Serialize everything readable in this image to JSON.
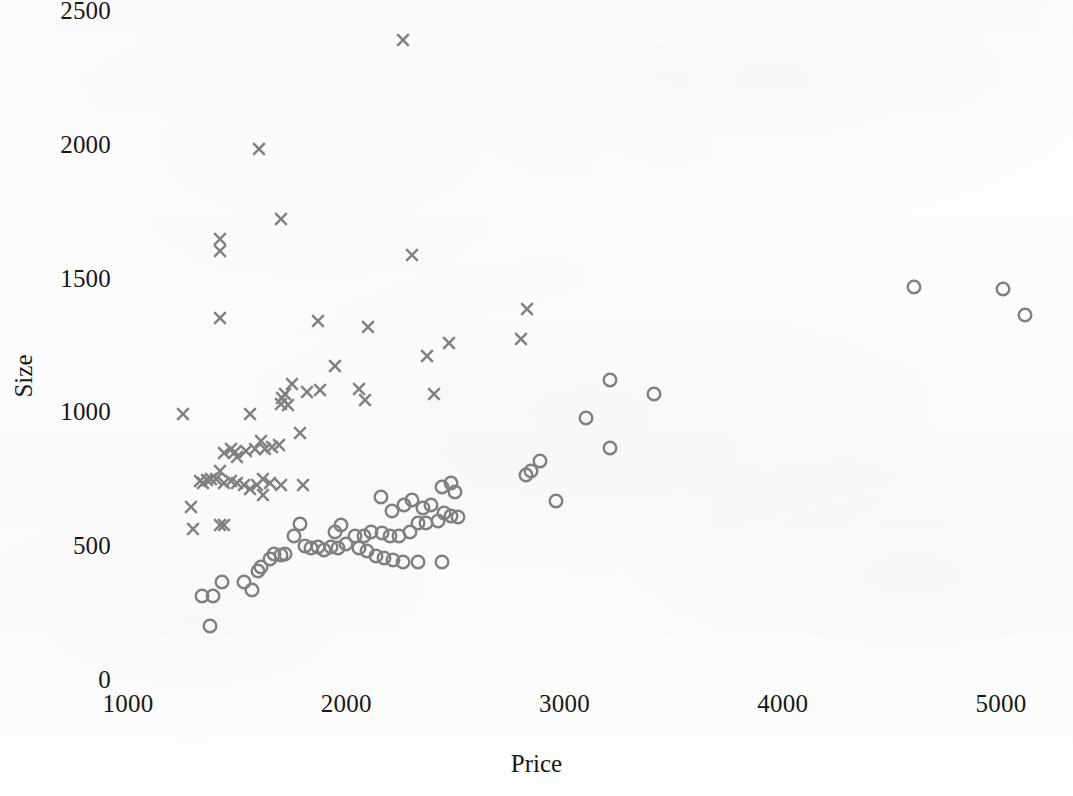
{
  "chart_data": {
    "type": "scatter",
    "title": "",
    "xlabel": "Price",
    "ylabel": "Size",
    "xlim": [
      1000,
      5200
    ],
    "ylim": [
      0,
      2500
    ],
    "xticks": [
      1000,
      2000,
      3000,
      4000,
      5000
    ],
    "yticks": [
      0,
      500,
      1000,
      1500,
      2000,
      2500
    ],
    "xtick_labels": [
      "1000",
      "2000",
      "3000",
      "4000",
      "5000"
    ],
    "ytick_labels": [
      "0",
      "500",
      "1000",
      "1500",
      "2000",
      "2500"
    ],
    "grid": false,
    "legend": "none",
    "marker_color": "#808080",
    "axis_text_color": "#17171a",
    "background_color": "#fdfdfd",
    "series": [
      {
        "name": "cross-series",
        "marker": "x",
        "color": "#808080",
        "points": [
          [
            2260,
            2400
          ],
          [
            1600,
            1990
          ],
          [
            1700,
            1730
          ],
          [
            1420,
            1655
          ],
          [
            1420,
            1610
          ],
          [
            2300,
            1595
          ],
          [
            1420,
            1360
          ],
          [
            1870,
            1350
          ],
          [
            2100,
            1325
          ],
          [
            2830,
            1395
          ],
          [
            2800,
            1280
          ],
          [
            2470,
            1265
          ],
          [
            2370,
            1220
          ],
          [
            1950,
            1180
          ],
          [
            2060,
            1095
          ],
          [
            2085,
            1055
          ],
          [
            2400,
            1075
          ],
          [
            1880,
            1090
          ],
          [
            1820,
            1085
          ],
          [
            1750,
            1115
          ],
          [
            1720,
            1075
          ],
          [
            1705,
            1060
          ],
          [
            1700,
            1040
          ],
          [
            1735,
            1035
          ],
          [
            1790,
            930
          ],
          [
            1560,
            1000
          ],
          [
            1250,
            1000
          ],
          [
            1610,
            900
          ],
          [
            1580,
            870
          ],
          [
            1540,
            865
          ],
          [
            1490,
            860
          ],
          [
            1470,
            870
          ],
          [
            1440,
            855
          ],
          [
            1500,
            840
          ],
          [
            1630,
            870
          ],
          [
            1660,
            880
          ],
          [
            1690,
            885
          ],
          [
            1420,
            790
          ],
          [
            1380,
            760
          ],
          [
            1360,
            755
          ],
          [
            1345,
            745
          ],
          [
            1330,
            750
          ],
          [
            1405,
            760
          ],
          [
            1440,
            745
          ],
          [
            1470,
            750
          ],
          [
            1500,
            745
          ],
          [
            1530,
            735
          ],
          [
            1560,
            720
          ],
          [
            1590,
            735
          ],
          [
            1620,
            760
          ],
          [
            1650,
            745
          ],
          [
            1700,
            735
          ],
          [
            1290,
            655
          ],
          [
            1300,
            570
          ],
          [
            1420,
            585
          ],
          [
            1440,
            585
          ],
          [
            1620,
            700
          ],
          [
            1800,
            735
          ]
        ]
      },
      {
        "name": "circle-series",
        "marker": "o",
        "color": "#808080",
        "points": [
          [
            4600,
            1475
          ],
          [
            5010,
            1470
          ],
          [
            5110,
            1370
          ],
          [
            3210,
            1130
          ],
          [
            3410,
            1075
          ],
          [
            3100,
            985
          ],
          [
            3210,
            875
          ],
          [
            2890,
            825
          ],
          [
            2845,
            790
          ],
          [
            2825,
            775
          ],
          [
            2960,
            675
          ],
          [
            2480,
            745
          ],
          [
            2440,
            730
          ],
          [
            2500,
            710
          ],
          [
            2300,
            680
          ],
          [
            2160,
            690
          ],
          [
            2390,
            660
          ],
          [
            2350,
            650
          ],
          [
            2265,
            660
          ],
          [
            2210,
            640
          ],
          [
            2450,
            630
          ],
          [
            2480,
            620
          ],
          [
            2510,
            615
          ],
          [
            2420,
            600
          ],
          [
            2365,
            595
          ],
          [
            2330,
            595
          ],
          [
            2290,
            560
          ],
          [
            2240,
            545
          ],
          [
            2200,
            545
          ],
          [
            2165,
            555
          ],
          [
            2115,
            560
          ],
          [
            2080,
            545
          ],
          [
            2040,
            545
          ],
          [
            2000,
            515
          ],
          [
            1960,
            500
          ],
          [
            1930,
            505
          ],
          [
            1900,
            495
          ],
          [
            1870,
            505
          ],
          [
            1840,
            500
          ],
          [
            1810,
            510
          ],
          [
            2060,
            500
          ],
          [
            2095,
            490
          ],
          [
            2135,
            470
          ],
          [
            2175,
            465
          ],
          [
            2215,
            455
          ],
          [
            2260,
            450
          ],
          [
            2330,
            450
          ],
          [
            2440,
            450
          ],
          [
            1975,
            585
          ],
          [
            1950,
            560
          ],
          [
            1790,
            590
          ],
          [
            1760,
            545
          ],
          [
            1720,
            480
          ],
          [
            1700,
            475
          ],
          [
            1670,
            480
          ],
          [
            1650,
            460
          ],
          [
            1610,
            430
          ],
          [
            1595,
            415
          ],
          [
            1570,
            345
          ],
          [
            1530,
            375
          ],
          [
            1430,
            375
          ],
          [
            1340,
            320
          ],
          [
            1390,
            320
          ],
          [
            1375,
            210
          ]
        ]
      }
    ]
  },
  "axes": {
    "y_title": "Size",
    "x_title": "Price"
  }
}
